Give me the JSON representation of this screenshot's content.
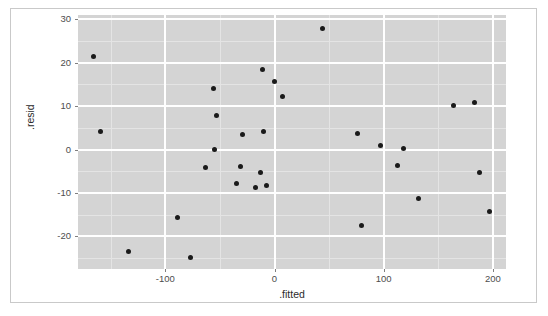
{
  "figure": {
    "panel_bg": "#d4d4d4",
    "grid_color": "#ffffff",
    "point_color": "#1a1a1a",
    "frame_color": "#c9c9c9"
  },
  "chart_data": {
    "type": "scatter",
    "title": "",
    "xlabel": ".fitted",
    "ylabel": ".resid",
    "xlim": [
      -180,
      212
    ],
    "ylim": [
      -27.5,
      31
    ],
    "grid": true,
    "legend": null,
    "xticks": [
      -100,
      0,
      100,
      200
    ],
    "xtick_labels": [
      "-100",
      "0",
      "100",
      "200"
    ],
    "yticks": [
      -20,
      -10,
      0,
      10,
      20,
      30
    ],
    "ytick_labels": [
      "-20",
      "-10",
      "0",
      "10",
      "20",
      "30"
    ],
    "x_minor_ticks": [
      -150,
      -50,
      50,
      150
    ],
    "y_minor_ticks": [
      -25,
      -15,
      -5,
      5,
      15,
      25
    ],
    "n_points": 30,
    "points": [
      {
        "x": -166,
        "y": 21.5
      },
      {
        "x": -159,
        "y": 4.1
      },
      {
        "x": -134,
        "y": -23.5
      },
      {
        "x": -89,
        "y": -15.7
      },
      {
        "x": -77,
        "y": -24.9
      },
      {
        "x": -63,
        "y": -4.2
      },
      {
        "x": -56,
        "y": 14.0
      },
      {
        "x": -55,
        "y": 0.0
      },
      {
        "x": -53,
        "y": 7.8
      },
      {
        "x": -35,
        "y": -7.8
      },
      {
        "x": -31,
        "y": -4.0
      },
      {
        "x": -29,
        "y": 3.5
      },
      {
        "x": -17,
        "y": -8.7
      },
      {
        "x": -13,
        "y": -5.3
      },
      {
        "x": -11,
        "y": 18.4
      },
      {
        "x": -10,
        "y": 4.2
      },
      {
        "x": -7,
        "y": -8.2
      },
      {
        "x": 0,
        "y": 15.6
      },
      {
        "x": 7,
        "y": 12.2
      },
      {
        "x": 44,
        "y": 27.9
      },
      {
        "x": 76,
        "y": 3.6
      },
      {
        "x": 80,
        "y": -17.5
      },
      {
        "x": 97,
        "y": 0.9
      },
      {
        "x": 113,
        "y": -3.6
      },
      {
        "x": 118,
        "y": 0.2
      },
      {
        "x": 132,
        "y": -11.2
      },
      {
        "x": 164,
        "y": 10.2
      },
      {
        "x": 183,
        "y": 10.9
      },
      {
        "x": 188,
        "y": -5.3
      },
      {
        "x": 197,
        "y": -14.3
      }
    ]
  }
}
